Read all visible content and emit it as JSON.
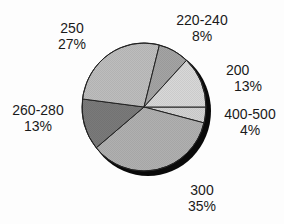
{
  "chart_data": {
    "type": "pie",
    "title": "",
    "start_angle_deg": 0,
    "direction": "clockwise",
    "slices": [
      {
        "label": "400-500",
        "percent": 4,
        "color": "#d2d2d2"
      },
      {
        "label": "300",
        "percent": 35,
        "color": "#b0b0b0"
      },
      {
        "label": "260-280",
        "percent": 13,
        "color": "#7a7a7a"
      },
      {
        "label": "250",
        "percent": 27,
        "color": "#bdbdbd"
      },
      {
        "label": "220-240",
        "percent": 8,
        "color": "#a4a4a4"
      },
      {
        "label": "200",
        "percent": 13,
        "color": "#d8d8d8"
      }
    ],
    "categories": [
      "400-500",
      "300",
      "260-280",
      "250",
      "220-240",
      "200"
    ],
    "values": [
      4,
      35,
      13,
      27,
      8,
      13
    ],
    "legend": "none",
    "shadow": true
  },
  "labels": {
    "s250": {
      "name": "250",
      "pct": "27%"
    },
    "s220": {
      "name": "220-240",
      "pct": "8%"
    },
    "s200": {
      "name": "200",
      "pct": "13%"
    },
    "s400": {
      "name": "400-500",
      "pct": "4%"
    },
    "s260": {
      "name": "260-280",
      "pct": "13%"
    },
    "s300": {
      "name": "300",
      "pct": "35%"
    }
  }
}
